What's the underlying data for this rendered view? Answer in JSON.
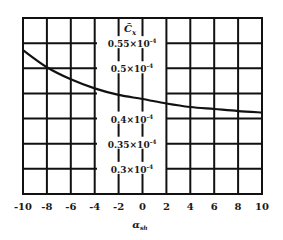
{
  "chart_data": {
    "type": "line",
    "title": "",
    "xlabel": "α_sh",
    "xlabel_main": "α",
    "xlabel_sub": "sh",
    "ylabel": "C̃x",
    "ylabel_main": "C̃",
    "ylabel_sub": "x",
    "xlim": [
      -10,
      10
    ],
    "ylim": [
      2.5e-05,
      6e-05
    ],
    "grid": true,
    "legend": null,
    "x_ticks": [
      -10,
      -8,
      -6,
      -4,
      -2,
      0,
      2,
      4,
      6,
      8,
      10
    ],
    "x_tick_labels": [
      "-10",
      "-8",
      "-6",
      "-4",
      "-2",
      "0",
      "2",
      "4",
      "6",
      "8",
      "10"
    ],
    "y_ticks": [
      3e-05,
      3.5e-05,
      4e-05,
      5e-05,
      5.5e-05
    ],
    "y_tick_labels": [
      {
        "mantissa": "0.3",
        "times": "×10",
        "exp": "-4",
        "value": 0.3
      },
      {
        "mantissa": "0.35",
        "times": "×10",
        "exp": "-4",
        "value": 0.35
      },
      {
        "mantissa": "0.4",
        "times": "×10",
        "exp": "-4",
        "value": 0.4
      },
      {
        "mantissa": "0.5",
        "times": "×10",
        "exp": "-4",
        "value": 0.5
      },
      {
        "mantissa": "0.55",
        "times": "×10",
        "exp": "-4",
        "value": 0.55
      }
    ],
    "y_gridlines": [
      0.3,
      0.35,
      0.4,
      0.45,
      0.5,
      0.55
    ],
    "y_unit_multiplier": "1e-4",
    "series": [
      {
        "name": "C̃x",
        "x": [
          -10,
          -8,
          -6,
          -4,
          -2,
          0,
          2,
          4,
          6,
          8,
          10
        ],
        "values": [
          0.536,
          0.502,
          0.478,
          0.46,
          0.447,
          0.439,
          0.43,
          0.423,
          0.419,
          0.415,
          0.412
        ],
        "color": "#111111"
      }
    ]
  },
  "layout": {
    "plot_left": 23,
    "plot_right": 262,
    "plot_top": 18,
    "plot_bottom": 194,
    "y_top_value": 0.6,
    "y_bottom_value": 0.25,
    "label_gap_left": 97,
    "label_gap_right": 167,
    "line_color": "#111111"
  }
}
